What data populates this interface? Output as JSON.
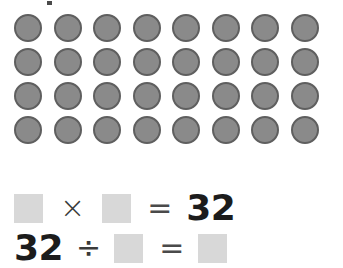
{
  "worksheet": {
    "array": {
      "rows": 4,
      "columns": 8,
      "total": 32,
      "counter_icon": "filled-circle-counter",
      "counter_fill_color": "#8a8a8a",
      "counter_border_color": "#5f5f5f"
    },
    "equations": [
      {
        "id": "multiplication",
        "tokens": [
          {
            "type": "blank",
            "value": ""
          },
          {
            "type": "operator",
            "value": "×",
            "name": "multiplication-sign"
          },
          {
            "type": "blank",
            "value": ""
          },
          {
            "type": "operator",
            "value": "=",
            "name": "equals-sign"
          },
          {
            "type": "number",
            "value": "32"
          }
        ]
      },
      {
        "id": "division",
        "tokens": [
          {
            "type": "number",
            "value": "32"
          },
          {
            "type": "operator",
            "value": "÷",
            "name": "division-sign"
          },
          {
            "type": "blank",
            "value": ""
          },
          {
            "type": "operator",
            "value": "=",
            "name": "equals-sign"
          },
          {
            "type": "blank",
            "value": ""
          }
        ]
      }
    ],
    "colors": {
      "background": "#ffffff",
      "blank_box": "#d8d8d8",
      "text": "#1c1c1c",
      "operator": "#3a3a3a"
    }
  }
}
